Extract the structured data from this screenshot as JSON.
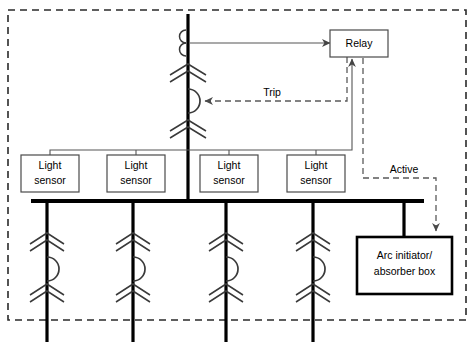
{
  "diagram": {
    "enclosure": {
      "name": "switchgear-enclosure",
      "style": "dashed"
    },
    "boxes": [
      {
        "id": "relay",
        "label": "Relay",
        "x": 330,
        "y": 30,
        "w": 58,
        "h": 27,
        "border": "thin"
      },
      {
        "id": "sensor1",
        "label_line1": "Light",
        "label_line2": "sensor",
        "x": 21,
        "y": 155,
        "w": 58,
        "h": 37,
        "border": "thin"
      },
      {
        "id": "sensor2",
        "label_line1": "Light",
        "label_line2": "sensor",
        "x": 107,
        "y": 155,
        "w": 58,
        "h": 37,
        "border": "thin"
      },
      {
        "id": "sensor3",
        "label_line1": "Light",
        "label_line2": "sensor",
        "x": 200,
        "y": 155,
        "w": 58,
        "h": 37,
        "border": "thin"
      },
      {
        "id": "sensor4",
        "label_line1": "Light",
        "label_line2": "sensor",
        "x": 287,
        "y": 155,
        "w": 58,
        "h": 37,
        "border": "thin"
      },
      {
        "id": "arcbox",
        "label_line1": "Arc initiator/",
        "label_line2": "absorber box",
        "x": 357,
        "y": 237,
        "w": 95,
        "h": 57,
        "border": "thick"
      }
    ],
    "labels": {
      "relay": "Relay",
      "light_sensor_l1": "Light",
      "light_sensor_l2": "sensor",
      "arc_box_l1": "Arc initiator/",
      "arc_box_l2": "absorber box",
      "trip": "Trip",
      "active": "Active"
    },
    "signals": [
      {
        "id": "ct-to-relay",
        "label": "",
        "type": "solid",
        "from": "current-transformer",
        "to": "relay"
      },
      {
        "id": "trip-signal",
        "label": "Trip",
        "type": "dashed",
        "from": "relay",
        "to": "main-breaker"
      },
      {
        "id": "sensor-to-relay",
        "label": "",
        "type": "solid",
        "from": "light-sensors",
        "to": "relay"
      },
      {
        "id": "active-signal",
        "label": "Active",
        "type": "dashed",
        "from": "relay",
        "to": "arc-initiator-absorber-box"
      }
    ],
    "feeders": [
      {
        "id": "feeder-1",
        "x": 47
      },
      {
        "id": "feeder-2",
        "x": 133
      },
      {
        "id": "feeder-3",
        "x": 226
      },
      {
        "id": "feeder-4",
        "x": 313
      }
    ],
    "colors": {
      "background": "#ffffff",
      "conductor": "#000000",
      "symbol": "#3a3a3a",
      "signal": "#555555",
      "enclosure": "#2a2a2a"
    }
  }
}
